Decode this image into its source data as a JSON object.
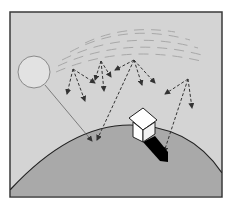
{
  "diagram": {
    "title": "",
    "elements": {
      "frame": {
        "label": ""
      },
      "sky": {
        "label": ""
      },
      "sun": {
        "label": ""
      },
      "atmosphere": {
        "label": ""
      },
      "earth": {
        "label": ""
      },
      "house": {
        "label": ""
      },
      "shadow": {
        "label": ""
      }
    },
    "colors": {
      "background": "#ffffff",
      "sky": "#d4d4d4",
      "frame_border": "#3a3a3a",
      "sun_fill": "#e2e2e2",
      "sun_stroke": "#8a8a8a",
      "atmosphere_lines": "#a8a8a8",
      "earth_fill": "#a9a9a9",
      "earth_outline": "#222222",
      "arrows": "#333333",
      "house_fill": "#ffffff",
      "shadow": "#000000"
    }
  }
}
